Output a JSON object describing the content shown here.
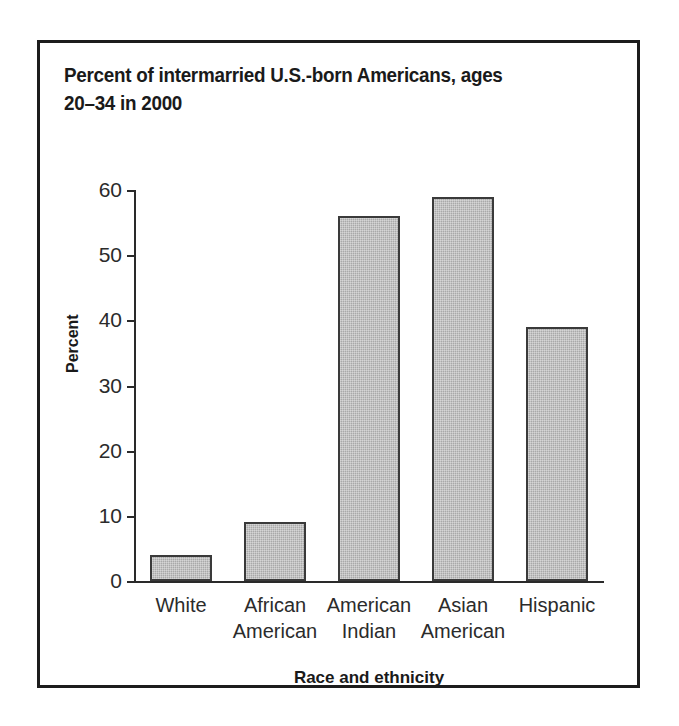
{
  "chart_data": {
    "type": "bar",
    "title": "Percent of intermarried U.S.-born Americans, ages 20–34 in 2000",
    "title_lines": [
      "Percent of intermarried U.S.-born Americans, ages",
      "20–34 in 2000"
    ],
    "categories": [
      "White",
      "African American",
      "American Indian",
      "Asian American",
      "Hispanic"
    ],
    "category_lines": [
      [
        "White"
      ],
      [
        "African",
        "American"
      ],
      [
        "American",
        "Indian"
      ],
      [
        "Asian",
        "American"
      ],
      [
        "Hispanic"
      ]
    ],
    "values": [
      4,
      9,
      56,
      59,
      39
    ],
    "xlabel": "Race and ethnicity",
    "ylabel": "Percent",
    "ylim": [
      0,
      60
    ],
    "yticks": [
      0,
      10,
      20,
      30,
      40,
      50,
      60
    ],
    "ytick_labels": [
      "0",
      "10",
      "20",
      "30",
      "40",
      "50",
      "60"
    ],
    "grid": false,
    "legend": false,
    "bar_color": "#a9a9a9",
    "bar_edge_color": "#3a3a3a",
    "frame_color": "#1c1c1c",
    "axis_color": "#2a2a2a",
    "background_color": "#ffffff"
  }
}
